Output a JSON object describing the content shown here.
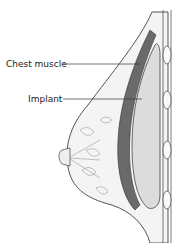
{
  "diagram": {
    "labels": {
      "chest_muscle": "Chest muscle",
      "implant": "Implant"
    },
    "colors": {
      "outline": "#444444",
      "muscle": "#6a6a6a",
      "implant": "#d8d8d8",
      "tissue": "#f2f2f2"
    }
  }
}
